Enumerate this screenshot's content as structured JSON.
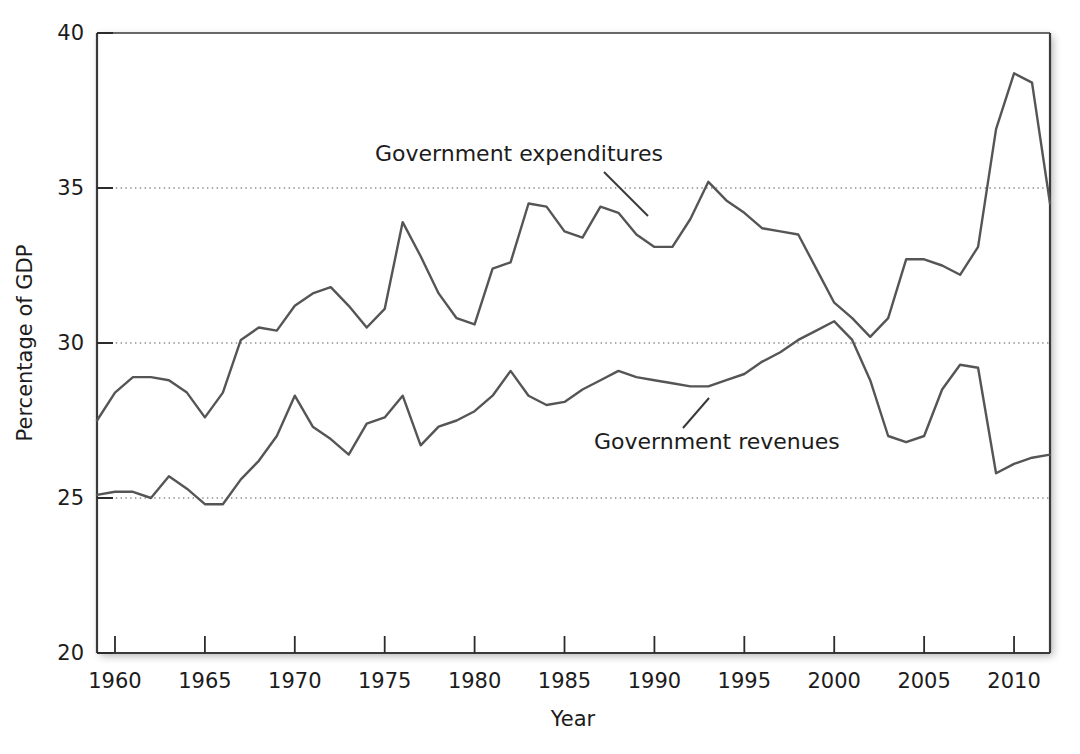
{
  "chart_data": {
    "type": "line",
    "title": "",
    "xlabel": "Year",
    "ylabel": "Percentage of GDP",
    "xlim": [
      1959,
      2012
    ],
    "ylim": [
      20,
      40
    ],
    "grid": "horizontal-dotted",
    "legend_position": "inline-annotations",
    "xticks": [
      1960,
      1965,
      1970,
      1975,
      1980,
      1985,
      1990,
      1995,
      2000,
      2005,
      2010
    ],
    "xtick_labels": [
      "1960",
      "1965",
      "1970",
      "1975",
      "1980",
      "1985",
      "1990",
      "1995",
      "2000",
      "2005",
      "2010"
    ],
    "yticks": [
      20,
      25,
      30,
      35,
      40
    ],
    "ytick_labels": [
      "20",
      "25",
      "30",
      "35",
      "40"
    ],
    "x": [
      1959,
      1960,
      1961,
      1962,
      1963,
      1964,
      1965,
      1966,
      1967,
      1968,
      1969,
      1970,
      1971,
      1972,
      1973,
      1974,
      1975,
      1976,
      1977,
      1978,
      1979,
      1980,
      1981,
      1982,
      1983,
      1984,
      1985,
      1986,
      1987,
      1988,
      1989,
      1990,
      1991,
      1992,
      1993,
      1994,
      1995,
      1996,
      1997,
      1998,
      1999,
      2000,
      2001,
      2002,
      2003,
      2004,
      2005,
      2006,
      2007,
      2008,
      2009,
      2010,
      2011,
      2012
    ],
    "series": [
      {
        "name": "Government expenditures",
        "color": "#555555",
        "values": [
          27.5,
          28.4,
          28.9,
          28.9,
          28.8,
          28.4,
          27.6,
          28.4,
          30.1,
          30.5,
          30.4,
          31.2,
          31.6,
          31.8,
          31.2,
          30.5,
          31.1,
          33.9,
          32.8,
          31.6,
          30.8,
          30.6,
          32.4,
          32.6,
          34.5,
          34.4,
          33.6,
          33.4,
          34.4,
          34.2,
          33.5,
          33.1,
          33.1,
          34.0,
          35.2,
          34.6,
          34.2,
          33.7,
          33.6,
          33.5,
          32.4,
          31.3,
          30.8,
          30.2,
          30.8,
          32.7,
          32.7,
          32.5,
          32.2,
          33.1,
          36.9,
          38.7,
          38.4,
          34.5
        ]
      },
      {
        "name": "Government revenues",
        "color": "#555555",
        "values": [
          25.1,
          25.2,
          25.2,
          25.0,
          25.7,
          25.3,
          24.8,
          24.8,
          25.6,
          26.2,
          27.0,
          28.3,
          27.3,
          26.9,
          26.4,
          27.4,
          27.6,
          28.3,
          26.7,
          27.3,
          27.5,
          27.8,
          28.3,
          29.1,
          28.3,
          28.0,
          28.1,
          28.5,
          28.8,
          29.1,
          28.9,
          28.8,
          28.7,
          28.6,
          28.6,
          28.8,
          29.0,
          29.4,
          29.7,
          30.1,
          30.4,
          30.7,
          30.1,
          28.8,
          27.0,
          26.8,
          27.0,
          28.5,
          29.3,
          29.2,
          25.8,
          26.1,
          26.3,
          26.4
        ]
      }
    ],
    "annotations": [
      {
        "text": "Government expenditures",
        "text_x": 375,
        "text_y": 161,
        "leader_from_x": 604,
        "leader_from_y": 172,
        "leader_to_x": 648,
        "leader_to_y": 216
      },
      {
        "text": "Government revenues",
        "text_x": 594,
        "text_y": 449,
        "leader_from_x": 683,
        "leader_from_y": 428,
        "leader_to_x": 709,
        "leader_to_y": 398
      }
    ]
  },
  "axes": {
    "y_axis_title": "Percentage of GDP",
    "x_axis_title": "Year"
  }
}
